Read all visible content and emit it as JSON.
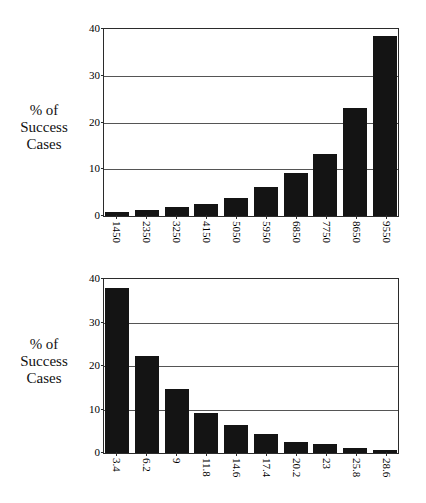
{
  "chart_data": [
    {
      "type": "bar",
      "id": "top",
      "title": "",
      "ylabel": "% of Success Cases",
      "ylabel_lines": [
        "% of",
        "Success",
        "Cases"
      ],
      "xlabel": "",
      "categories": [
        "1450",
        "2350",
        "3250",
        "4150",
        "5050",
        "5950",
        "6850",
        "7750",
        "8650",
        "9550"
      ],
      "values": [
        0.8,
        1.3,
        1.9,
        2.6,
        3.8,
        6.2,
        9.1,
        13.2,
        23.2,
        38.4
      ],
      "yticks": [
        0,
        10,
        20,
        30,
        40
      ],
      "ylim": [
        0,
        40
      ],
      "grid": true,
      "legend": "none",
      "bar_color": "#141414"
    },
    {
      "type": "bar",
      "id": "bottom",
      "title": "",
      "ylabel": "% of Success Cases",
      "ylabel_lines": [
        "% of",
        "Success",
        "Cases"
      ],
      "xlabel": "",
      "categories": [
        "3.4",
        "6.2",
        "9",
        "11.8",
        "14.6",
        "17.4",
        "20.2",
        "23",
        "25.8",
        "28.6"
      ],
      "values": [
        38.0,
        22.3,
        14.8,
        9.1,
        6.4,
        4.3,
        2.6,
        2.0,
        1.1,
        0.8
      ],
      "yticks": [
        0,
        10,
        20,
        30,
        40
      ],
      "ylim": [
        0,
        40
      ],
      "grid": true,
      "legend": "none",
      "bar_color": "#141414"
    }
  ]
}
